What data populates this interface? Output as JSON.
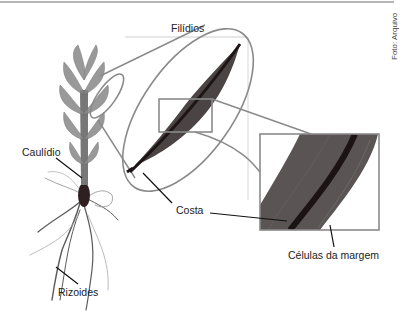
{
  "figure": {
    "credit": "Foto: Arquivo",
    "labels": {
      "filidios": "Filídios",
      "caulidio": "Caulídio",
      "rizoides": "Rizoides",
      "costa": "Costa",
      "celulas_margem": "Células da margem"
    },
    "colors": {
      "outline": "#8a8a8a",
      "leaf": "#4a4444",
      "midrib": "#1e1616",
      "plant": "#6f6f6f",
      "leader": "#111111"
    }
  }
}
